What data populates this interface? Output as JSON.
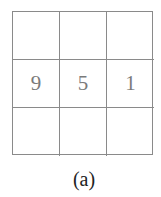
{
  "grid": {
    "rows": 3,
    "cols": 3,
    "cells": [
      [
        "",
        "",
        ""
      ],
      [
        "9",
        "5",
        "1"
      ],
      [
        "",
        "",
        ""
      ]
    ]
  },
  "caption": "(a)",
  "colors": {
    "line": "#8a8a8a",
    "digit": "#7a7a7a",
    "caption": "#222222"
  }
}
